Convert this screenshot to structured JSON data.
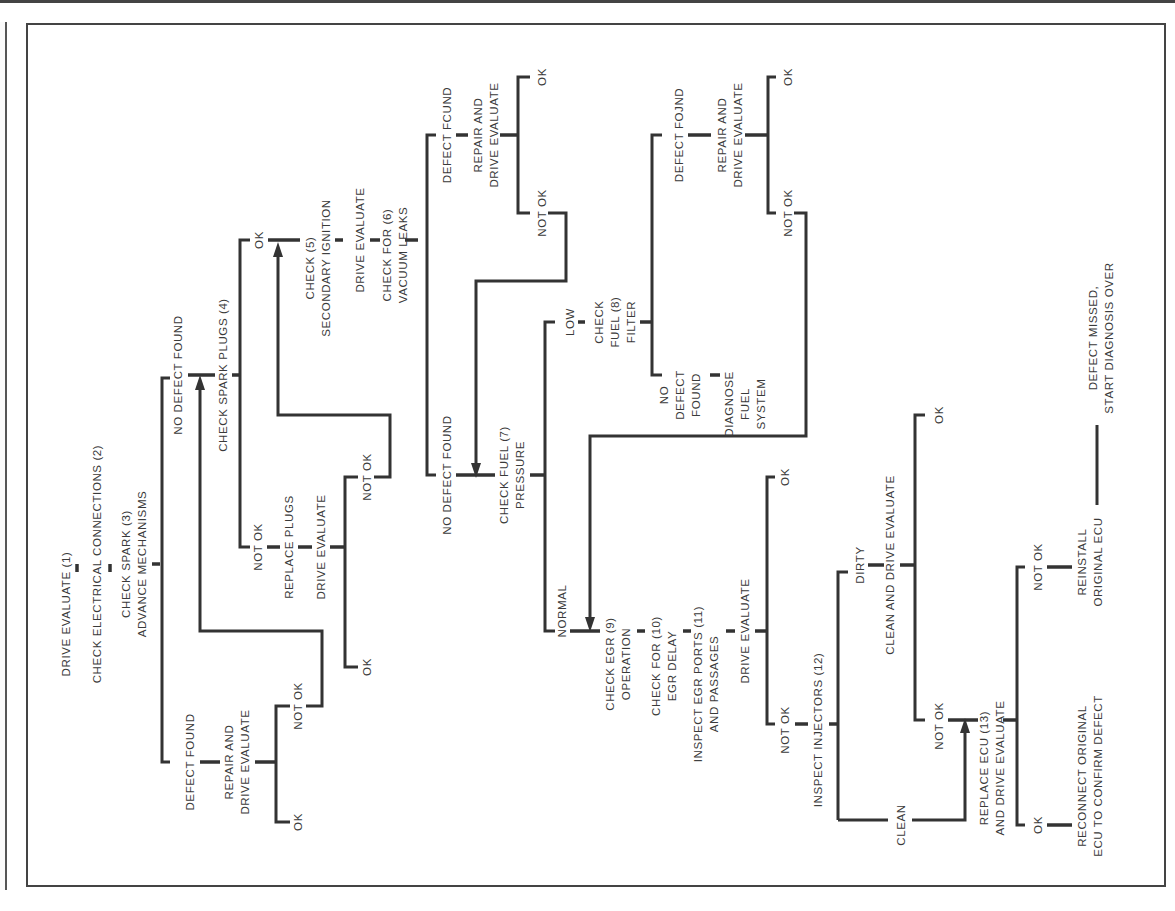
{
  "diagram": {
    "type": "troubleshooting-flowchart",
    "orientation": "rotated-90-ccw",
    "nodes": {
      "n1": [
        "DRIVE EVALUATE (1)"
      ],
      "n2": [
        "CHECK ELECTRICAL CONNECTIONS (2)"
      ],
      "n3": [
        "CHECK SPARK (3)",
        "ADVANCE MECHANISMS"
      ],
      "n3_defect": [
        "DEFECT FOUND"
      ],
      "n3_repair": [
        "REPAIR AND",
        "DRIVE EVALUATE"
      ],
      "n3_repair_ok": [
        "OK"
      ],
      "n3_repair_notok": [
        "NOT OK"
      ],
      "n3_nodefect": [
        "NO DEFECT FOUND"
      ],
      "n4": [
        "CHECK SPARK PLUGS (4)"
      ],
      "n4_notok": [
        "NOT OK"
      ],
      "n4_replace": [
        "REPLACE PLUGS"
      ],
      "n4_drive": [
        "DRIVE EVALUATE"
      ],
      "n4_drive_ok": [
        "OK"
      ],
      "n4_drive_notok": [
        "NOT OK"
      ],
      "n4_ok": [
        "OK"
      ],
      "n5": [
        "CHECK (5)",
        "SECONDARY IGNITION"
      ],
      "n5_drive": [
        "DRIVE EVALUATE"
      ],
      "n6": [
        "CHECK FOR (6)",
        "VACUUM LEAKS"
      ],
      "n6_defect": [
        "DEFECT FCUND"
      ],
      "n6_repair": [
        "REPAIR AND",
        "DRIVE EVALUATE"
      ],
      "n6_repair_ok": [
        "OK"
      ],
      "n6_repair_notok": [
        "NOT OK"
      ],
      "n6_nodefect": [
        "NO DEFECT FOUND"
      ],
      "n7": [
        "CHECK FUEL (7)",
        "PRESSURE"
      ],
      "n7_low": [
        "LOW"
      ],
      "n8": [
        "CHECK",
        "FUEL (8)",
        "FILTER"
      ],
      "n8_defect": [
        "DEFECT FOJND"
      ],
      "n8_repair": [
        "REPAIR AND",
        "DRIVE EVALUATE"
      ],
      "n8_repair_ok": [
        "OK"
      ],
      "n8_repair_notok": [
        "NOT OK"
      ],
      "n8_nodefect": [
        "NO",
        "DEFECT",
        "FOUND"
      ],
      "n8_diagnose": [
        "DIAGNOSE",
        "FUEL",
        "SYSTEM"
      ],
      "n7_normal": [
        "NORMAL"
      ],
      "n9": [
        "CHECK EGR (9)",
        "OPERATION"
      ],
      "n10": [
        "CHECK FOR (10)",
        "EGR DELAY"
      ],
      "n11": [
        "INSPECT EGR PORTS (11)",
        "AND PASSAGES"
      ],
      "n11_drive": [
        "DRIVE EVALUATE"
      ],
      "n11_drive_ok": [
        "OK"
      ],
      "n11_drive_notok": [
        "NOT OK"
      ],
      "n12": [
        "INSPECT INJECTORS (12)"
      ],
      "n12_dirty": [
        "DIRTY"
      ],
      "n12_clean_drive": [
        "CLEAN AND DRIVE EVALUATE"
      ],
      "n12_clean_drive_ok": [
        "OK"
      ],
      "n12_clean_drive_notok": [
        "NOT OK"
      ],
      "n12_clean": [
        "CLEAN"
      ],
      "n13": [
        "REPLACE ECU (13)",
        "AND DRIVE EVALUATE"
      ],
      "n13_ok": [
        "OK"
      ],
      "n13_reconnect": [
        "RECONNECT ORIGINAL",
        "ECU TO CONFIRM DEFECT"
      ],
      "n13_notok": [
        "NOT OK"
      ],
      "n13_reinstall": [
        "REINSTALL",
        "ORIGINAL ECU"
      ],
      "n13_missed": [
        "DEFECT MISSED,",
        "START DIAGNOSIS OVER"
      ]
    },
    "colors": {
      "ink": "#333333",
      "paper": "#ffffff",
      "text": "#3a3a3a"
    }
  }
}
